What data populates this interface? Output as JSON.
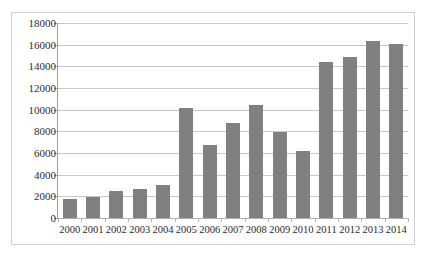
{
  "chart_data": {
    "type": "bar",
    "title": "",
    "subtitle": "",
    "xlabel": "",
    "ylabel": "",
    "categories": [
      "2000",
      "2001",
      "2002",
      "2003",
      "2004",
      "2005",
      "2006",
      "2007",
      "2008",
      "2009",
      "2010",
      "2011",
      "2012",
      "2013",
      "2014"
    ],
    "values": [
      1800,
      1950,
      2500,
      2700,
      3050,
      10200,
      6700,
      8800,
      10400,
      7900,
      6200,
      14400,
      14900,
      16300,
      16100
    ],
    "series": [
      {
        "name": "Series 1",
        "values": [
          1800,
          1950,
          2500,
          2700,
          3050,
          10200,
          6700,
          8800,
          10400,
          7900,
          6200,
          14400,
          14900,
          16300,
          16100
        ]
      }
    ],
    "ylim": [
      0,
      18000
    ],
    "ytick_values": [
      0,
      2000,
      4000,
      6000,
      8000,
      10000,
      12000,
      14000,
      16000,
      18000
    ],
    "ytick_labels": [
      "0",
      "2000",
      "4000",
      "6000",
      "8000",
      "10000",
      "12000",
      "14000",
      "16000",
      "18000"
    ],
    "grid": true,
    "grid_axis": "y",
    "legend": false,
    "legend_position": "none",
    "bar_color": "#808080",
    "gridline_color": "#c8c8c8",
    "axis_color": "#9e9e9e",
    "background_color": "#ffffff",
    "border_color": "#cfcfcf"
  }
}
